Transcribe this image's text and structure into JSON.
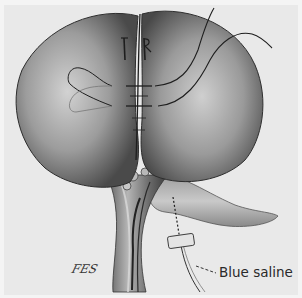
{
  "figure": {
    "type": "surgical-illustration",
    "style": "grayscale pencil shading",
    "colors": {
      "background": "#e9e9e9",
      "border": "#f4f4f4",
      "organ_shade_dark": "#4a4a4a",
      "organ_shade_light": "#cfcfcf",
      "line": "#1e1e1e"
    },
    "labels": [
      {
        "id": "blue-saline",
        "text": "Blue saline"
      }
    ],
    "signature": "FES"
  }
}
